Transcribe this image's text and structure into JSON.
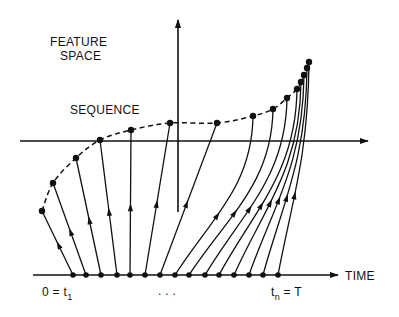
{
  "labels": {
    "feature_space_line1": "FEATURE",
    "feature_space_line2": "SPACE",
    "sequence": "SEQUENCE",
    "time": "TIME",
    "start": "0 = t",
    "start_sub": "1",
    "end": "t",
    "end_sub": "n",
    "end_suffix": " = T",
    "ellipsis": ". . ."
  },
  "colors": {
    "ink": "#111111",
    "background": "#ffffff"
  },
  "geometry": {
    "vertical_axis": {
      "x": 178,
      "y_top": 20,
      "y_bottom": 212
    },
    "feature_axis": {
      "y": 141,
      "x_left": 20,
      "x_right": 368
    },
    "time_axis": {
      "y": 275,
      "x_left": 33,
      "x_right": 338
    }
  },
  "base_points_x": [
    73,
    86,
    101,
    117,
    130,
    145,
    160,
    175,
    189,
    205,
    219,
    234,
    249,
    263,
    278
  ],
  "sequence_points": [
    [
      42,
      211
    ],
    [
      53,
      183
    ],
    [
      76,
      158
    ],
    [
      100,
      140
    ],
    [
      131,
      130
    ],
    [
      170,
      123
    ],
    [
      217,
      123
    ],
    [
      253,
      116
    ],
    [
      273,
      109
    ],
    [
      287,
      98
    ],
    [
      297,
      89
    ],
    [
      301,
      82
    ],
    [
      304,
      75
    ],
    [
      307,
      68
    ],
    [
      309,
      62
    ]
  ]
}
